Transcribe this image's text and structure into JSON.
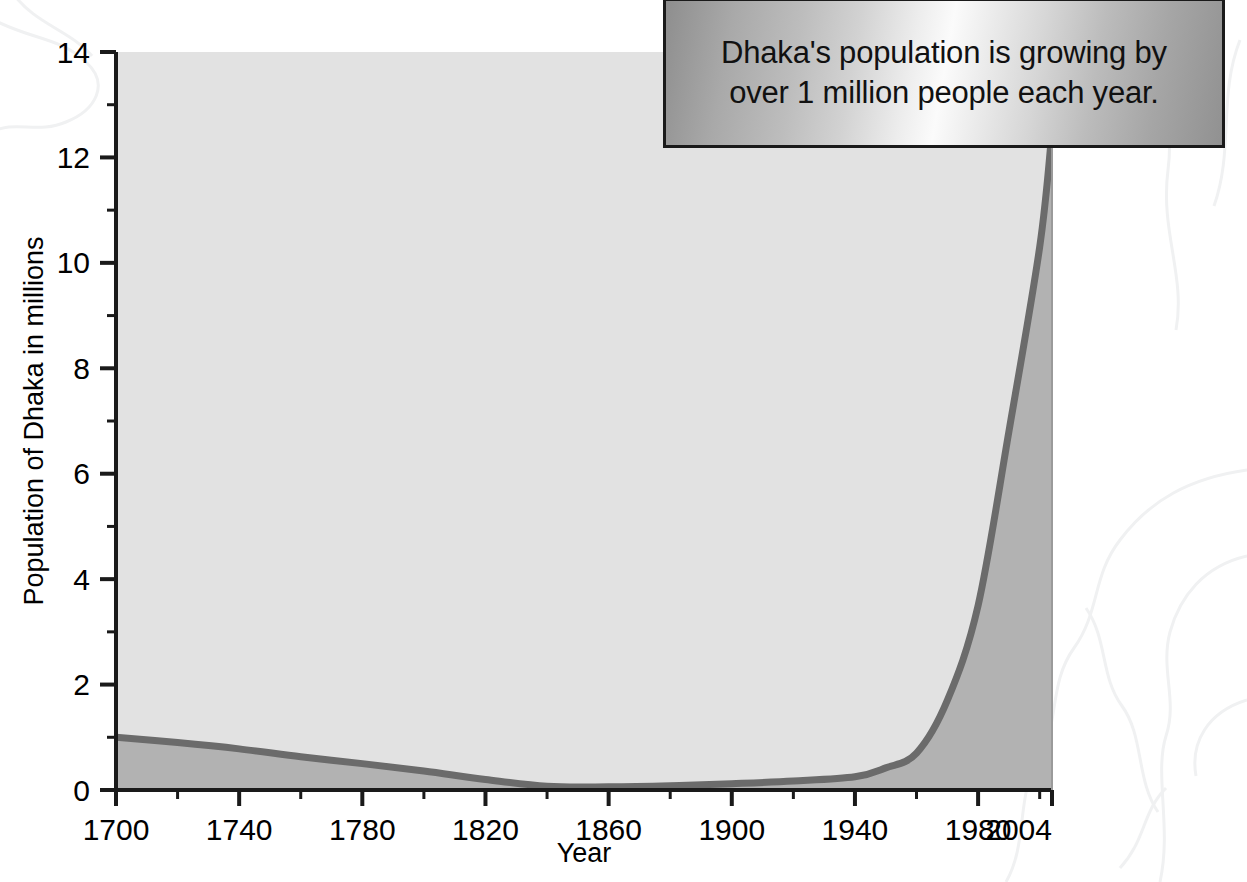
{
  "callout": {
    "name": "callout-annotation",
    "line1": "Dhaka's population is growing by",
    "line2": "over 1 million people each year."
  },
  "chart_data": {
    "type": "area",
    "title": "",
    "subtitle": "",
    "xlabel": "Year",
    "ylabel": "Population of Dhaka in millions",
    "xlim": [
      1700,
      2004
    ],
    "ylim": [
      0,
      14
    ],
    "grid": false,
    "legend_position": "none",
    "x_tick_labels": [
      "1700",
      "1740",
      "1780",
      "1820",
      "1860",
      "1900",
      "1940",
      "1980",
      "2004"
    ],
    "x_tick_values": [
      1700,
      1740,
      1780,
      1820,
      1860,
      1900,
      1940,
      1980,
      2004
    ],
    "x_minor_tick_values": [
      1720,
      1760,
      1800,
      1840,
      1880,
      1920,
      1960,
      2000
    ],
    "y_tick_labels": [
      "0",
      "2",
      "4",
      "6",
      "8",
      "10",
      "12",
      "14"
    ],
    "y_tick_values": [
      0,
      2,
      4,
      6,
      8,
      10,
      12,
      14
    ],
    "y_minor_tick_values": [
      1,
      3,
      5,
      7,
      9,
      11,
      13
    ],
    "series": [
      {
        "name": "Population of Dhaka",
        "x": [
          1700,
          1720,
          1740,
          1760,
          1780,
          1800,
          1820,
          1840,
          1860,
          1880,
          1900,
          1920,
          1940,
          1950,
          1960,
          1970,
          1980,
          1990,
          2000,
          2004
        ],
        "values": [
          1.0,
          0.9,
          0.78,
          0.63,
          0.5,
          0.36,
          0.2,
          0.07,
          0.06,
          0.08,
          0.12,
          0.17,
          0.25,
          0.42,
          0.7,
          1.7,
          3.5,
          6.8,
          10.3,
          12.5
        ]
      }
    ],
    "annotations": [
      "Dhaka's population is growing by over 1 million people each year."
    ],
    "colors": {
      "line": "#6b6b6b",
      "fill_above_curve": "#e2e2e2",
      "fill_below_curve": "#b2b2b2",
      "axis": "#1a1a1a",
      "text": "#000000",
      "page_background": "#ffffff"
    }
  }
}
